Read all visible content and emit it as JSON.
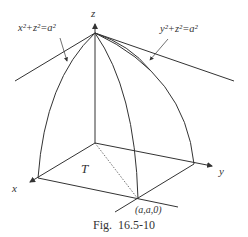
{
  "figure": {
    "caption_prefix": "Fig.",
    "caption_number": "16.5-10",
    "axes": {
      "x_label": "x",
      "y_label": "y",
      "z_label": "z"
    },
    "labels": {
      "region": "T",
      "point": "(a,a,0)",
      "surface_left": "x²+z²=a²",
      "surface_right": "y²+z²=a²"
    },
    "colors": {
      "stroke": "#333333",
      "background": "#ffffff"
    }
  }
}
